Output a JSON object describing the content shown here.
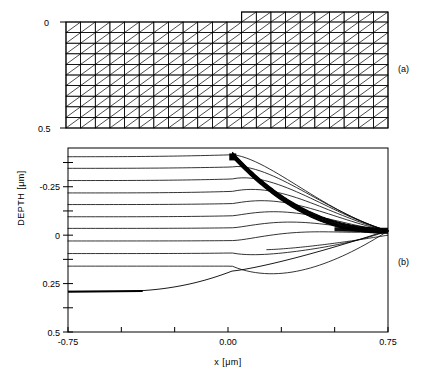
{
  "figure": {
    "panels": [
      {
        "id": "a",
        "label": "(a)",
        "type": "mesh",
        "description": "triangular finite-element mesh of a stepped substrate",
        "y_ticks": [
          {
            "value": "0",
            "label": "0"
          },
          {
            "value": "0.5",
            "label": "0.5"
          }
        ],
        "mesh": {
          "columns_left": 12,
          "columns_right": 10,
          "rows_main": 10,
          "rows_step": 1,
          "step_x_index": 12,
          "diagonal_direction": "up-right"
        }
      },
      {
        "id": "b",
        "label": "(b)",
        "type": "contour",
        "ylabel": "DEPTH [μm]",
        "xlabel": "x [μm]",
        "x_ticks": [
          {
            "value": -0.75,
            "label": "-0.75"
          },
          {
            "value": -0.5,
            "label": ""
          },
          {
            "value": -0.25,
            "label": ""
          },
          {
            "value": 0.0,
            "label": "0.00"
          },
          {
            "value": 0.25,
            "label": ""
          },
          {
            "value": 0.5,
            "label": ""
          },
          {
            "value": 0.75,
            "label": "0.75"
          }
        ],
        "y_ticks": [
          {
            "value": -0.375,
            "label": ""
          },
          {
            "value": -0.25,
            "label": "-0.25"
          },
          {
            "value": -0.125,
            "label": ""
          },
          {
            "value": 0.0,
            "label": "0"
          },
          {
            "value": 0.125,
            "label": ""
          },
          {
            "value": 0.25,
            "label": "0.25"
          },
          {
            "value": 0.375,
            "label": ""
          },
          {
            "value": 0.5,
            "label": "0.5"
          }
        ]
      }
    ]
  },
  "chart_data": {
    "type": "line",
    "title": "",
    "subtitle": "",
    "xlabel": "x [μm]",
    "ylabel": "DEPTH [μm]",
    "xlim": [
      -0.75,
      0.75
    ],
    "ylim": [
      0.5,
      -0.45
    ],
    "grid": false,
    "legend": "none",
    "annotations": [
      "(a)",
      "(b)"
    ],
    "panel_a": {
      "type": "mesh",
      "ylim": [
        0.5,
        -0.06
      ],
      "xlim": [
        -0.75,
        0.75
      ],
      "y_tick_values": [
        0,
        0.5
      ],
      "y_tick_labels": [
        "0",
        "0.5"
      ],
      "n_cols": 22,
      "n_rows": 10,
      "step_col": 12,
      "step_height": 0.06
    },
    "panel_b": {
      "type": "contour",
      "note": "dopant iso-concentration contours over a stepped surface; contours converge into a dense bundle along the sloped surface",
      "x_tick_values": [
        -0.75,
        -0.5,
        -0.25,
        0.0,
        0.25,
        0.5,
        0.75
      ],
      "x_tick_labels": [
        "-0.75",
        "",
        "",
        "0.00",
        "",
        "",
        "0.75"
      ],
      "y_tick_values": [
        -0.375,
        -0.25,
        -0.125,
        0.0,
        0.125,
        0.25,
        0.375,
        0.5
      ],
      "y_tick_labels": [
        "",
        "-0.25",
        "",
        "0",
        "",
        "0.25",
        "",
        "0.5"
      ],
      "series": [
        {
          "name": "contour-1",
          "left_depth": -0.405,
          "right_depth": -0.022,
          "weight": "thin"
        },
        {
          "name": "contour-2",
          "left_depth": -0.345,
          "right_depth": -0.022,
          "weight": "thin"
        },
        {
          "name": "contour-3",
          "left_depth": -0.282,
          "right_depth": -0.022,
          "weight": "thin"
        },
        {
          "name": "contour-4",
          "left_depth": -0.218,
          "right_depth": -0.022,
          "weight": "thin"
        },
        {
          "name": "contour-5",
          "left_depth": -0.158,
          "right_depth": -0.022,
          "weight": "thin"
        },
        {
          "name": "contour-6",
          "left_depth": -0.095,
          "right_depth": -0.022,
          "weight": "thin"
        },
        {
          "name": "contour-7",
          "left_depth": -0.035,
          "right_depth": -0.022,
          "weight": "thin"
        },
        {
          "name": "contour-8",
          "left_depth": 0.03,
          "right_depth": -0.022,
          "weight": "thin"
        },
        {
          "name": "contour-9",
          "left_depth": 0.095,
          "right_depth": -0.022,
          "weight": "thin"
        },
        {
          "name": "contour-10",
          "left_depth": 0.16,
          "right_depth": 0.0,
          "weight": "thin"
        },
        {
          "name": "surface-bundle",
          "left_depth": 0.29,
          "right_depth": -0.025,
          "weight": "bold"
        }
      ]
    }
  }
}
